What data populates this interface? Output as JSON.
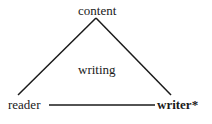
{
  "diagram": {
    "nodes": {
      "top": "content",
      "center": "writing",
      "bottom_left": "reader",
      "bottom_right": "writer*"
    },
    "emphasized_node": "writer*",
    "line_color": "#1a1a1a"
  }
}
